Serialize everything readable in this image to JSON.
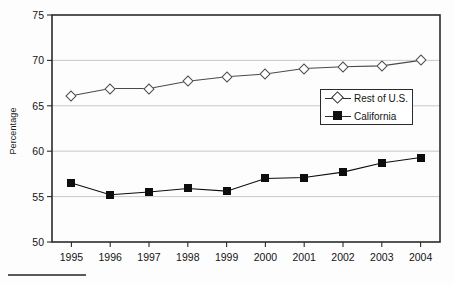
{
  "chart_data": {
    "type": "line",
    "title": "",
    "subtitle": "",
    "xlabel": "",
    "ylabel": "Percentage",
    "categories": [
      "1995",
      "1996",
      "1997",
      "1998",
      "1999",
      "2000",
      "2001",
      "2002",
      "2003",
      "2004"
    ],
    "ylim": [
      50,
      75
    ],
    "yticks": [
      50,
      55,
      60,
      65,
      70,
      75
    ],
    "ytick_labels": [
      "50",
      "55",
      "60",
      "65",
      "70",
      "75"
    ],
    "grid": "horizontal",
    "legend_position": "upper-right-inside",
    "series": [
      {
        "name": "Rest of U.S.",
        "marker": "open-diamond",
        "color": "#4a4a4a",
        "values": [
          66.1,
          66.9,
          66.9,
          67.7,
          68.2,
          68.5,
          69.1,
          69.3,
          69.4,
          70.0
        ]
      },
      {
        "name": "California",
        "marker": "filled-square",
        "color": "#0d0d0d",
        "values": [
          56.5,
          55.2,
          55.5,
          55.9,
          55.6,
          57.0,
          57.1,
          57.7,
          58.7,
          59.3
        ]
      }
    ],
    "annotations": []
  },
  "legend": {
    "entries": [
      {
        "label": "Rest of U.S.",
        "marker": "open-diamond-icon"
      },
      {
        "label": "California",
        "marker": "filled-square-icon"
      }
    ]
  },
  "footnote": {
    "rule": "footnote-separator"
  }
}
